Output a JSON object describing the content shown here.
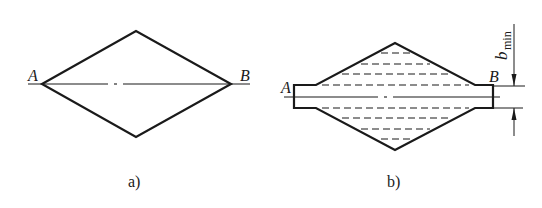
{
  "figure_a": {
    "caption": "a)",
    "label_left": "A",
    "label_right": "B"
  },
  "figure_b": {
    "caption": "b)",
    "label_left": "A",
    "label_right": "B",
    "dimension_label": "b",
    "dimension_subscript": "min"
  },
  "colors": {
    "stroke": "#1a1a1a",
    "background": "#ffffff"
  }
}
